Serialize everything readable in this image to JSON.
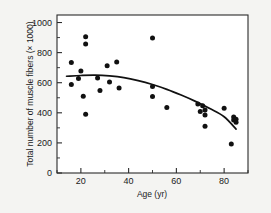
{
  "chart_data": {
    "type": "scatter",
    "title": "",
    "xlabel": "Age (yr)",
    "ylabel": "Total number of muscle fibers (× 1000)",
    "xlim": [
      10,
      90
    ],
    "ylim": [
      0,
      1050
    ],
    "grid": false,
    "legend": false,
    "x_ticks_major": [
      20,
      40,
      60,
      80
    ],
    "x_tick_labels": [
      "20",
      "40",
      "60",
      "80"
    ],
    "x_ticks_minor": [
      10,
      30,
      50,
      70,
      90
    ],
    "y_ticks_major": [
      0,
      200,
      400,
      600,
      800,
      1000
    ],
    "y_tick_labels": [
      "0",
      "200",
      "400",
      "600",
      "800",
      "1000"
    ],
    "y_ticks_minor": [
      100,
      300,
      500,
      700,
      900
    ],
    "point_color": "#111111",
    "curve_color": "#111111",
    "frame_color": "#2b2b2b",
    "background_color": "#f4f4f2",
    "plot_background_color": "#ffffff",
    "series": [
      {
        "name": "Muscle fiber count by age",
        "points": [
          [
            16,
            735
          ],
          [
            16,
            588
          ],
          [
            19,
            628
          ],
          [
            20,
            678
          ],
          [
            21,
            510
          ],
          [
            22,
            905
          ],
          [
            22,
            858
          ],
          [
            22,
            390
          ],
          [
            27,
            632
          ],
          [
            28,
            548
          ],
          [
            31,
            712
          ],
          [
            32,
            604
          ],
          [
            35,
            738
          ],
          [
            36,
            565
          ],
          [
            50,
            897
          ],
          [
            50,
            575
          ],
          [
            50,
            508
          ],
          [
            56,
            435
          ],
          [
            69,
            458
          ],
          [
            70,
            408
          ],
          [
            71,
            447
          ],
          [
            72,
            418
          ],
          [
            72,
            385
          ],
          [
            72,
            310
          ],
          [
            80,
            430
          ],
          [
            83,
            192
          ],
          [
            84,
            372
          ],
          [
            84,
            352
          ],
          [
            85,
            358
          ],
          [
            85,
            338
          ]
        ]
      }
    ],
    "fit_curve": {
      "name": "fitted trend",
      "points": [
        [
          14,
          643
        ],
        [
          20,
          648
        ],
        [
          26,
          650
        ],
        [
          32,
          645
        ],
        [
          38,
          634
        ],
        [
          44,
          614
        ],
        [
          50,
          588
        ],
        [
          56,
          556
        ],
        [
          62,
          518
        ],
        [
          68,
          476
        ],
        [
          74,
          428
        ],
        [
          80,
          374
        ],
        [
          85,
          292
        ]
      ]
    }
  }
}
